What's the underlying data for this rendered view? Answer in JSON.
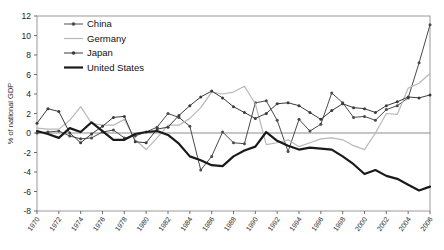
{
  "chart_data": {
    "type": "line",
    "title": "",
    "xlabel": "",
    "ylabel": "% of national GDP",
    "ylim": [
      -8,
      12
    ],
    "yticks": [
      12,
      10,
      8,
      6,
      4,
      2,
      0,
      -2,
      -4,
      -6,
      -8
    ],
    "grid": false,
    "legend_position": "top-left-inside",
    "x": [
      1970,
      1971,
      1972,
      1973,
      1974,
      1975,
      1976,
      1977,
      1978,
      1979,
      1980,
      1981,
      1982,
      1983,
      1984,
      1985,
      1986,
      1987,
      1988,
      1989,
      1990,
      1991,
      1992,
      1993,
      1994,
      1995,
      1996,
      1997,
      1998,
      1999,
      2000,
      2001,
      2002,
      2003,
      2004,
      2005,
      2006
    ],
    "xticks": [
      1970,
      1972,
      1974,
      1976,
      1978,
      1980,
      1982,
      1984,
      1986,
      1988,
      1990,
      1992,
      1994,
      1996,
      1998,
      2000,
      2002,
      2004,
      2006
    ],
    "xtick_labels": [
      "1970",
      "1972",
      "1974",
      "1976",
      "1978",
      "1980",
      "1982",
      "1984",
      "1986",
      "1988",
      "1990",
      "1992",
      "1994",
      "1996",
      "1998",
      "2000",
      "2002",
      "2004",
      "2006"
    ],
    "series": [
      {
        "name": "China",
        "color": "#4a4a4a",
        "style": "line-marker",
        "width": 1.0,
        "marker": "dot",
        "values": [
          0.0,
          0.1,
          0.2,
          -0.3,
          -0.6,
          -0.5,
          0.1,
          0.3,
          -0.5,
          -0.3,
          0.1,
          0.6,
          2.0,
          1.6,
          0.7,
          -3.8,
          -2.4,
          0.1,
          -1.0,
          -1.1,
          3.1,
          3.3,
          1.3,
          -1.9,
          1.4,
          0.2,
          0.9,
          4.1,
          3.1,
          1.6,
          1.7,
          1.3,
          2.4,
          2.8,
          3.6,
          7.2,
          11.1
        ]
      },
      {
        "name": "Germany",
        "color": "#b8b8b8",
        "style": "line",
        "width": 1.2,
        "marker": "none",
        "values": [
          0.5,
          0.4,
          0.4,
          1.3,
          2.7,
          1.0,
          0.8,
          0.8,
          1.4,
          -0.7,
          -1.7,
          -0.5,
          0.8,
          0.8,
          1.5,
          2.6,
          4.2,
          4.0,
          4.2,
          4.8,
          3.0,
          -1.2,
          -1.0,
          -0.7,
          -1.4,
          -1.0,
          -0.6,
          -0.5,
          -0.7,
          -1.3,
          -1.7,
          0.0,
          2.0,
          1.9,
          4.6,
          5.1,
          6.1
        ]
      },
      {
        "name": "Japan",
        "color": "#3b3b3b",
        "style": "line-marker",
        "width": 1.0,
        "marker": "dot",
        "values": [
          1.0,
          2.5,
          2.2,
          0.0,
          -1.0,
          -0.1,
          0.7,
          1.6,
          1.7,
          -0.9,
          -1.0,
          0.4,
          0.6,
          1.8,
          2.8,
          3.7,
          4.3,
          3.6,
          2.7,
          2.1,
          1.5,
          2.0,
          3.0,
          3.1,
          2.8,
          2.1,
          1.4,
          2.3,
          3.0,
          2.6,
          2.5,
          2.1,
          2.8,
          3.2,
          3.7,
          3.6,
          3.9
        ]
      },
      {
        "name": "United States",
        "color": "#1a1a1a",
        "style": "line",
        "width": 2.2,
        "marker": "none",
        "values": [
          0.2,
          -0.1,
          -0.5,
          0.5,
          0.1,
          1.1,
          0.2,
          -0.7,
          -0.7,
          -0.1,
          0.1,
          0.2,
          -0.2,
          -1.1,
          -2.4,
          -2.8,
          -3.3,
          -3.4,
          -2.4,
          -1.8,
          -1.4,
          0.1,
          -0.8,
          -1.3,
          -1.7,
          -1.5,
          -1.6,
          -1.7,
          -2.4,
          -3.2,
          -4.2,
          -3.8,
          -4.4,
          -4.7,
          -5.3,
          -5.9,
          -5.5
        ]
      }
    ]
  },
  "legend": {
    "items": [
      {
        "label": "China"
      },
      {
        "label": "Germany"
      },
      {
        "label": "Japan"
      },
      {
        "label": "United States"
      }
    ]
  },
  "axis": {
    "y_title": "% of national GDP"
  }
}
